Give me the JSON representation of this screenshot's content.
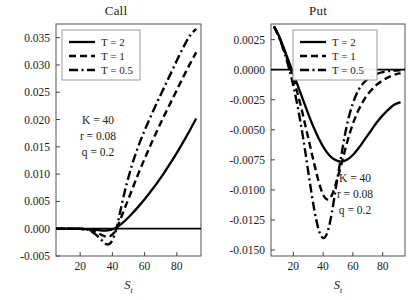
{
  "figure": {
    "width": 419,
    "height": 300,
    "background": "#ffffff",
    "line_color": "#000000"
  },
  "panels": [
    {
      "key": "call",
      "title": "Call",
      "xlabel_main": "S",
      "xlabel_sub": "t",
      "annotations": [
        "K = 40",
        "r = 0.08",
        "q = 0.2"
      ],
      "legend": [
        "T = 2",
        "T = 1",
        "T = 0.5"
      ]
    },
    {
      "key": "put",
      "title": "Put",
      "xlabel_main": "S",
      "xlabel_sub": "t",
      "annotations": [
        "K = 40",
        "r = 0.08",
        "q = 0.2"
      ],
      "legend": [
        "T = 2",
        "T = 1",
        "T = 0.5"
      ]
    }
  ],
  "chart_data": [
    {
      "type": "line",
      "title": "Call",
      "xlabel": "S_t",
      "ylabel": "",
      "xlim": [
        5,
        95
      ],
      "ylim": [
        -0.005,
        0.0375
      ],
      "xticks": [
        20,
        40,
        60,
        80
      ],
      "yticks": [
        -0.005,
        0.0,
        0.005,
        0.01,
        0.015,
        0.02,
        0.025,
        0.03,
        0.035
      ],
      "ytick_labels": [
        "-0.005",
        "0.000",
        "0.005",
        "0.010",
        "0.015",
        "0.020",
        "0.025",
        "0.030",
        "0.035"
      ],
      "xtick_labels": [
        "20",
        "40",
        "60",
        "80"
      ],
      "grid": false,
      "legend_position": "upper-left",
      "annotations": [
        "K = 40",
        "r = 0.08",
        "q = 0.2"
      ],
      "zero_line": 0.0,
      "series": [
        {
          "name": "T = 2",
          "style": "solid",
          "x": [
            5,
            10,
            15,
            20,
            25,
            30,
            33,
            35,
            37,
            39,
            41,
            43,
            45,
            48,
            52,
            56,
            60,
            64,
            68,
            72,
            76,
            80,
            84,
            88,
            92
          ],
          "values": [
            0.0,
            0.0,
            0.0,
            -2e-05,
            -8e-05,
            -0.00022,
            -0.00032,
            -0.00035,
            -0.00032,
            -0.00022,
            -2e-05,
            0.0003,
            0.00075,
            0.0015,
            0.0027,
            0.004,
            0.0054,
            0.0069,
            0.0085,
            0.0102,
            0.012,
            0.0139,
            0.0159,
            0.018,
            0.0202
          ]
        },
        {
          "name": "T = 1",
          "style": "dashed",
          "x": [
            5,
            10,
            15,
            20,
            25,
            30,
            33,
            35,
            37,
            39,
            41,
            43,
            45,
            48,
            52,
            56,
            60,
            64,
            68,
            72,
            76,
            80,
            84,
            88,
            92
          ],
          "values": [
            0.0,
            0.0,
            0.0,
            -3e-05,
            -0.00018,
            -0.0007,
            -0.0011,
            -0.00135,
            -0.00145,
            -0.0013,
            -0.00075,
            0.0003,
            0.0017,
            0.004,
            0.007,
            0.01,
            0.0128,
            0.0155,
            0.0181,
            0.0206,
            0.023,
            0.0254,
            0.0278,
            0.0301,
            0.0323
          ]
        },
        {
          "name": "T = 0.5",
          "style": "dashdot",
          "x": [
            5,
            10,
            15,
            20,
            25,
            30,
            33,
            35,
            37,
            39,
            41,
            43,
            45,
            48,
            52,
            56,
            60,
            64,
            68,
            72,
            76,
            80,
            84,
            88,
            92
          ],
          "values": [
            0.0,
            0.0,
            0.0,
            -2e-05,
            -0.0002,
            -0.00115,
            -0.002,
            -0.0026,
            -0.0029,
            -0.00255,
            -0.0014,
            0.0006,
            0.0033,
            0.0072,
            0.0115,
            0.015,
            0.018,
            0.0207,
            0.0233,
            0.0258,
            0.0283,
            0.0308,
            0.0332,
            0.0353,
            0.0366
          ]
        }
      ]
    },
    {
      "type": "line",
      "title": "Put",
      "xlabel": "S_t",
      "ylabel": "",
      "xlim": [
        5,
        95
      ],
      "ylim": [
        -0.0155,
        0.0038
      ],
      "xticks": [
        20,
        40,
        60,
        80
      ],
      "yticks": [
        -0.015,
        -0.0125,
        -0.01,
        -0.0075,
        -0.005,
        -0.0025,
        0.0,
        0.0025
      ],
      "ytick_labels": [
        "-0.0150",
        "-0.0125",
        "-0.0100",
        "-0.0075",
        "-0.0050",
        "-0.0025",
        "0.0000",
        "0.0025"
      ],
      "xtick_labels": [
        "20",
        "40",
        "60",
        "80"
      ],
      "grid": false,
      "legend_position": "upper-center",
      "annotations": [
        "K = 40",
        "r = 0.08",
        "q = 0.2"
      ],
      "zero_line": 0.0,
      "series": [
        {
          "name": "T = 2",
          "style": "solid",
          "x": [
            7,
            10,
            13,
            16,
            19,
            22,
            25,
            28,
            31,
            34,
            37,
            40,
            44,
            48,
            52,
            56,
            60,
            64,
            68,
            72,
            76,
            80,
            84,
            88,
            92
          ],
          "values": [
            0.0036,
            0.0029,
            0.002,
            0.001,
            0.0,
            -0.001,
            -0.002,
            -0.003,
            -0.004,
            -0.0049,
            -0.0057,
            -0.0064,
            -0.0071,
            -0.0075,
            -0.00765,
            -0.0075,
            -0.0071,
            -0.0065,
            -0.0058,
            -0.0051,
            -0.0044,
            -0.0038,
            -0.0033,
            -0.0029,
            -0.0027
          ]
        },
        {
          "name": "T = 1",
          "style": "dashed",
          "x": [
            7,
            10,
            13,
            16,
            19,
            22,
            25,
            28,
            31,
            34,
            37,
            40,
            43,
            46,
            49,
            52,
            56,
            60,
            64,
            68,
            72,
            76,
            80,
            84,
            88,
            92
          ],
          "values": [
            0.0036,
            0.00285,
            0.0019,
            0.00085,
            -0.0003,
            -0.0016,
            -0.003,
            -0.0046,
            -0.0062,
            -0.0078,
            -0.0093,
            -0.0104,
            -0.0108,
            -0.0104,
            -0.0093,
            -0.008,
            -0.0061,
            -0.0045,
            -0.0033,
            -0.0024,
            -0.00175,
            -0.00125,
            -0.0009,
            -0.00062,
            -0.00042,
            -0.00028
          ]
        },
        {
          "name": "T = 0.5",
          "style": "dashdot",
          "x": [
            7,
            10,
            13,
            16,
            19,
            22,
            25,
            28,
            31,
            34,
            37,
            40,
            43,
            46,
            49,
            52,
            56,
            60,
            64,
            68,
            72,
            76,
            80,
            84,
            88,
            92
          ],
          "values": [
            0.0036,
            0.0028,
            0.0018,
            0.0006,
            -0.0008,
            -0.0025,
            -0.0045,
            -0.0068,
            -0.0093,
            -0.0116,
            -0.0133,
            -0.014,
            -0.0135,
            -0.0118,
            -0.0095,
            -0.0073,
            -0.0046,
            -0.0028,
            -0.00165,
            -0.001,
            -0.0006,
            -0.00035,
            -0.0002,
            -0.00012,
            -8e-05,
            -5e-05
          ]
        }
      ]
    }
  ]
}
